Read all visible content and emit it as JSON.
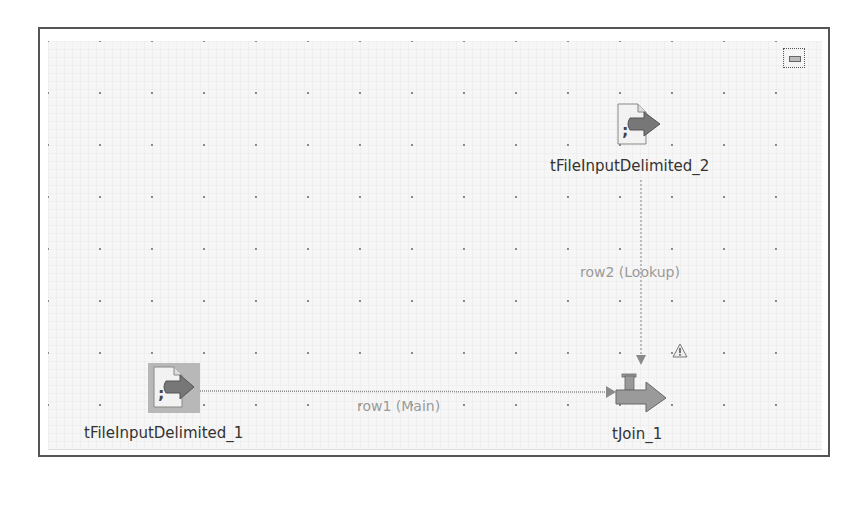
{
  "canvas": {
    "minimize_button": "minimize-icon"
  },
  "components": [
    {
      "id": "tFileInputDelimited_1",
      "label": "tFileInputDelimited_1",
      "icon": "file-input-delimited-icon",
      "selected": true
    },
    {
      "id": "tFileInputDelimited_2",
      "label": "tFileInputDelimited_2",
      "icon": "file-input-delimited-icon",
      "selected": false
    },
    {
      "id": "tJoin_1",
      "label": "tJoin_1",
      "icon": "join-icon",
      "warning": true
    }
  ],
  "links": [
    {
      "from": "tFileInputDelimited_1",
      "to": "tJoin_1",
      "label": "row1 (Main)",
      "style": "solid"
    },
    {
      "from": "tFileInputDelimited_2",
      "to": "tJoin_1",
      "label": "row2 (Lookup)",
      "style": "dotted"
    }
  ],
  "colors": {
    "arrow": "#7a7a7a",
    "link_main": "#888888",
    "link_lookup": "#999999",
    "selection": "#b5b5b5"
  }
}
